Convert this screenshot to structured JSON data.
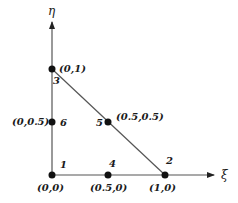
{
  "diagram": {
    "axes": {
      "x_label": "ξ",
      "y_label": "η"
    },
    "nodes": [
      {
        "number": "1",
        "coord": "(0,0)"
      },
      {
        "number": "2",
        "coord": "(1,0)"
      },
      {
        "number": "3",
        "coord": "(0,1)"
      },
      {
        "number": "4",
        "coord": "(0.5,0)"
      },
      {
        "number": "5",
        "coord": "(0.5,0.5)"
      },
      {
        "number": "6",
        "coord": "(0,0.5)"
      }
    ],
    "colors": {
      "line": "#555555",
      "node": "#111111"
    }
  }
}
